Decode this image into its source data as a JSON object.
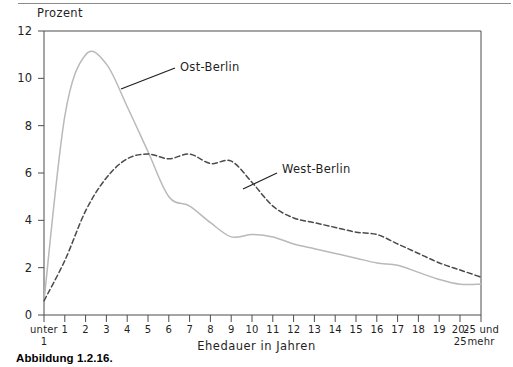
{
  "figure": {
    "caption": "Abbildung 1.2.16.",
    "y_axis_title": "Prozent",
    "x_axis_title": "Ehedauer in Jahren"
  },
  "annotations": [
    {
      "name": "ost-berlin",
      "text": "Ost-Berlin"
    },
    {
      "name": "west-berlin",
      "text": "West-Berlin"
    }
  ],
  "chart_data": {
    "type": "line",
    "title": "",
    "subtitle": "",
    "xlabel": "Ehedauer in Jahren",
    "ylabel": "Prozent",
    "ylim": [
      0,
      12
    ],
    "yticks": [
      0,
      2,
      4,
      6,
      8,
      10,
      12
    ],
    "ytick_labels": [
      "0",
      "2",
      "4",
      "6",
      "8",
      "10",
      "12"
    ],
    "grid": false,
    "legend_position": "inline-annotation",
    "categories": [
      "unter 1",
      "1",
      "2",
      "3",
      "4",
      "5",
      "6",
      "7",
      "8",
      "9",
      "10",
      "11",
      "12",
      "13",
      "14",
      "15",
      "16",
      "17",
      "18",
      "19",
      "20-25",
      "25 und mehr"
    ],
    "category_labels_multiline": [
      [
        "unter",
        "1"
      ],
      [
        "1",
        ""
      ],
      [
        "2",
        ""
      ],
      [
        "3",
        ""
      ],
      [
        "4",
        ""
      ],
      [
        "5",
        ""
      ],
      [
        "6",
        ""
      ],
      [
        "7",
        ""
      ],
      [
        "8",
        ""
      ],
      [
        "9",
        ""
      ],
      [
        "10",
        ""
      ],
      [
        "11",
        ""
      ],
      [
        "12",
        ""
      ],
      [
        "13",
        ""
      ],
      [
        "14",
        ""
      ],
      [
        "15",
        ""
      ],
      [
        "16",
        ""
      ],
      [
        "17",
        ""
      ],
      [
        "18",
        ""
      ],
      [
        "19",
        ""
      ],
      [
        "20-",
        "25"
      ],
      [
        "25 und",
        "mehr"
      ]
    ],
    "series": [
      {
        "name": "Ost-Berlin",
        "style": "solid",
        "color": "#b9b9b9",
        "values": [
          0.6,
          8.4,
          11.0,
          10.6,
          8.8,
          6.9,
          5.0,
          4.6,
          3.9,
          3.3,
          3.4,
          3.3,
          3.0,
          2.8,
          2.6,
          2.4,
          2.2,
          2.1,
          1.8,
          1.5,
          1.3,
          1.3
        ]
      },
      {
        "name": "West-Berlin",
        "style": "dashed",
        "color": "#4a4a4a",
        "values": [
          0.6,
          2.3,
          4.4,
          5.8,
          6.6,
          6.8,
          6.6,
          6.8,
          6.4,
          6.5,
          5.6,
          4.6,
          4.1,
          3.9,
          3.7,
          3.5,
          3.4,
          3.0,
          2.6,
          2.2,
          1.9,
          1.6
        ]
      }
    ]
  },
  "colors": {
    "ost_berlin": "#b9b9b9",
    "west_berlin": "#4a4a4a",
    "axis": "#4d4d4d",
    "rule": "#8a8a8a"
  }
}
